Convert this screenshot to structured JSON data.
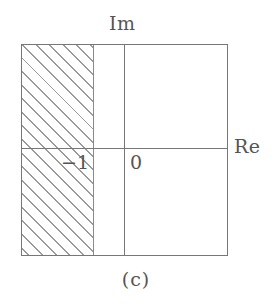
{
  "figure": {
    "caption": "(c)",
    "axes": {
      "imaginary_label": "Im",
      "real_label": "Re"
    },
    "tick_labels": [
      {
        "name": "minus-one",
        "text": "−1"
      },
      {
        "name": "zero",
        "text": "0"
      }
    ],
    "shaded_region": {
      "description": "hatched",
      "hatch_angle_deg": 45,
      "hatch_color": "#9a9a9a",
      "fill_color": "#ffffff"
    },
    "colors": {
      "line": "#777777",
      "text": "#555555",
      "background": "#ffffff"
    }
  },
  "chart_data": {
    "type": "area",
    "title": "(c)",
    "xlabel": "Re",
    "ylabel": "Im",
    "grid": false,
    "legend": null,
    "xlim": [
      -3,
      3
    ],
    "ylim": [
      -3,
      3
    ],
    "x_tick_labels": [
      "−1",
      "0"
    ],
    "x_ticks": [
      -1,
      0
    ],
    "y_ticks": [],
    "y_tick_labels": [],
    "annotations": [
      {
        "text": "Im",
        "position": "top-of-vertical-axis"
      },
      {
        "text": "Re",
        "position": "right-of-horizontal-axis"
      },
      {
        "text": "−1",
        "position": "left-of-origin-below-axis"
      },
      {
        "text": "0",
        "position": "right-of-origin-below-axis"
      }
    ],
    "regions": [
      {
        "name": "shaded-half-plane",
        "style": "hatched",
        "x_range": [
          -3,
          -1
        ],
        "y_range": [
          -3,
          3
        ],
        "meaning": "Re(s) < -1"
      }
    ]
  }
}
